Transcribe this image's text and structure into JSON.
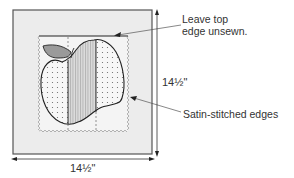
{
  "diagram": {
    "callouts": {
      "top_edge_line1": "Leave top",
      "top_edge_line2": "edge unsewn.",
      "satin_edges": "Satin-stitched edges"
    },
    "dimensions": {
      "width": "14½\"",
      "height": "14½\""
    },
    "colors": {
      "outer_square_fill": "#ececec",
      "outer_square_stroke": "#555555",
      "inner_square_fill": "#f3f3f3",
      "leaf_fill": "#9a9a9a",
      "center_strip_fill": "#d8d8d8",
      "dotted_fabric_fill": "#f7f7f7",
      "line_color": "#222222"
    }
  }
}
